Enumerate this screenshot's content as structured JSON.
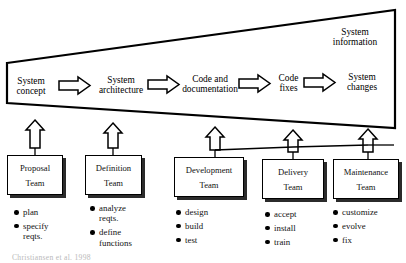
{
  "diagram": {
    "system_information_label": "System\ninformation",
    "info_line1": "System",
    "info_line2": "information",
    "stages": [
      {
        "id": "system-concept",
        "line1": "System",
        "line2": "concept"
      },
      {
        "id": "system-architecture",
        "line1": "System",
        "line2": "architecture"
      },
      {
        "id": "code-and-documentation",
        "line1": "Code and",
        "line2": "documentation"
      },
      {
        "id": "code-fixes",
        "line1": "Code",
        "line2": "fixes"
      },
      {
        "id": "system-changes",
        "line1": "System",
        "line2": "changes"
      }
    ],
    "flow_arrow_icon": "right-arrow-icon",
    "feedback_arrow_icon": "up-arrow-icon",
    "teams": [
      {
        "id": "proposal-team",
        "name_line1": "Proposal",
        "name_line2": "Team",
        "tasks": [
          {
            "lines": [
              "plan"
            ]
          },
          {
            "lines": [
              "specify",
              "reqts."
            ]
          }
        ]
      },
      {
        "id": "definition-team",
        "name_line1": "Definition",
        "name_line2": "Team",
        "tasks": [
          {
            "lines": [
              "analyze",
              "reqts."
            ]
          },
          {
            "lines": [
              "define",
              "functions"
            ]
          }
        ]
      },
      {
        "id": "development-team",
        "name_line1": "Development",
        "name_line2": "Team",
        "tasks": [
          {
            "lines": [
              "design"
            ]
          },
          {
            "lines": [
              "build"
            ]
          },
          {
            "lines": [
              "test"
            ]
          }
        ]
      },
      {
        "id": "delivery-team",
        "name_line1": "Delivery",
        "name_line2": "Team",
        "tasks": [
          {
            "lines": [
              "accept"
            ]
          },
          {
            "lines": [
              "install"
            ]
          },
          {
            "lines": [
              "train"
            ]
          }
        ]
      },
      {
        "id": "maintenance-team",
        "name_line1": "Maintenance",
        "name_line2": "Team",
        "tasks": [
          {
            "lines": [
              "customize"
            ]
          },
          {
            "lines": [
              "evolve"
            ]
          },
          {
            "lines": [
              "fix"
            ]
          }
        ]
      }
    ],
    "caption": "Christiansen et al. 1998",
    "colors": {
      "stroke": "#000000",
      "shadow": "#2b2b2b",
      "background": "#ffffff",
      "caption": "#b9b9b9"
    }
  }
}
